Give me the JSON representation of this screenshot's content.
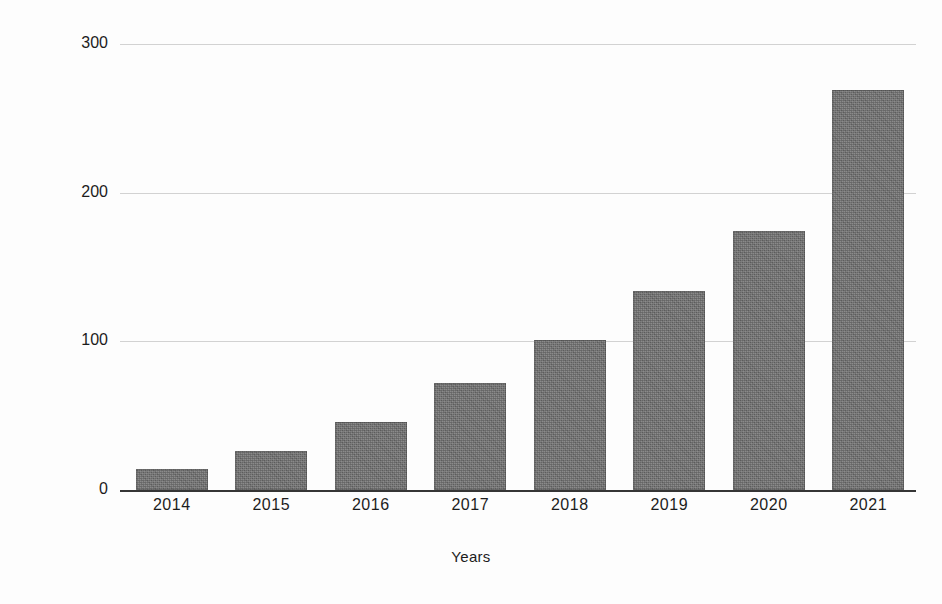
{
  "chart_data": {
    "type": "bar",
    "title": "",
    "xlabel": "Years",
    "ylabel": "# Of Repositories (1000s)",
    "categories": [
      "2014",
      "2015",
      "2016",
      "2017",
      "2018",
      "2019",
      "2020",
      "2021"
    ],
    "values": [
      14,
      26,
      46,
      72,
      101,
      134,
      174,
      269
    ],
    "ylim": [
      0,
      300
    ],
    "yticks": [
      "0",
      "100",
      "200",
      "300"
    ],
    "ytick_values": [
      0,
      100,
      200,
      300
    ],
    "grid": "horizontal",
    "legend": "none",
    "series": [
      {
        "name": "# Of Repositories (1000s)",
        "values": [
          14,
          26,
          46,
          72,
          101,
          134,
          174,
          269
        ]
      }
    ],
    "colors": {
      "bar_fill": "#6e6e6e",
      "gridline": "#d2d2d2",
      "axis_line": "#1f1f1f",
      "text": "#1c1c1c",
      "background": "#fdfdfd"
    }
  }
}
